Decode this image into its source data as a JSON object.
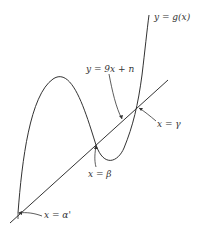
{
  "diagram": {
    "labels": {
      "curve": "y = g(x)",
      "line": "y = 9x + n",
      "gamma": "x = γ",
      "beta": "x = β",
      "alpha": "x = α'"
    },
    "colors": {
      "stroke": "#333333",
      "background": "#ffffff"
    }
  }
}
